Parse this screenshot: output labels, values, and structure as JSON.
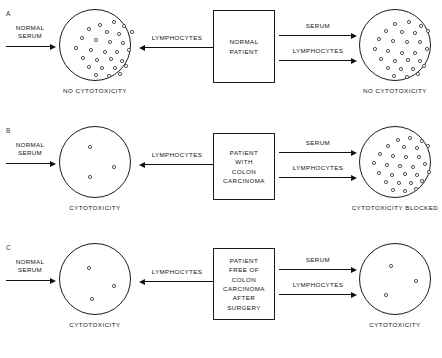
{
  "figure": {
    "type": "diagram",
    "panels": [
      {
        "letter": "A",
        "left_stimulus_label": "NORMAL\nSERUM",
        "middle_arrow_label": "LYMPHOCYTES",
        "center_box_lines": [
          "NORMAL",
          "PATIENT"
        ],
        "right_arrow_labels": [
          "SERUM",
          "LYMPHOCYTES"
        ],
        "left_dish": {
          "caption": "NO CYTOTOXICITY",
          "cell_count": 27,
          "cells": [
            [
              38,
              13
            ],
            [
              52,
              10
            ],
            [
              62,
              14
            ],
            [
              27,
              17
            ],
            [
              45,
              20
            ],
            [
              57,
              22
            ],
            [
              70,
              20
            ],
            [
              20,
              26
            ],
            [
              34,
              28
            ],
            [
              48,
              30
            ],
            [
              61,
              31
            ],
            [
              14,
              36
            ],
            [
              29,
              38
            ],
            [
              43,
              40
            ],
            [
              55,
              40
            ],
            [
              67,
              38
            ],
            [
              21,
              46
            ],
            [
              35,
              48
            ],
            [
              49,
              47
            ],
            [
              60,
              49
            ],
            [
              27,
              55
            ],
            [
              40,
              56
            ],
            [
              53,
              56
            ],
            [
              64,
              54
            ],
            [
              34,
              63
            ],
            [
              47,
              64
            ],
            [
              58,
              62
            ]
          ]
        },
        "right_dish": {
          "caption": "NO CYTOTOXICITY",
          "cell_count": 27,
          "cells": [
            [
              33,
              12
            ],
            [
              47,
              10
            ],
            [
              59,
              14
            ],
            [
              24,
              19
            ],
            [
              40,
              20
            ],
            [
              53,
              21
            ],
            [
              66,
              19
            ],
            [
              17,
              27
            ],
            [
              31,
              29
            ],
            [
              45,
              30
            ],
            [
              58,
              30
            ],
            [
              13,
              37
            ],
            [
              26,
              39
            ],
            [
              40,
              41
            ],
            [
              53,
              41
            ],
            [
              65,
              37
            ],
            [
              19,
              47
            ],
            [
              33,
              49
            ],
            [
              46,
              48
            ],
            [
              58,
              49
            ],
            [
              26,
              56
            ],
            [
              39,
              57
            ],
            [
              51,
              57
            ],
            [
              62,
              54
            ],
            [
              32,
              64
            ],
            [
              45,
              65
            ],
            [
              56,
              62
            ]
          ]
        }
      },
      {
        "letter": "B",
        "left_stimulus_label": "NORMAL\nSERUM",
        "middle_arrow_label": "LYMPHOCYTES",
        "center_box_lines": [
          "PATIENT",
          "WITH",
          "COLON",
          "CARCINOMA"
        ],
        "right_arrow_labels": [
          "SERUM",
          "LYMPHOCYTES"
        ],
        "left_dish": {
          "caption": "CYTOTOXICITY",
          "cell_count": 3,
          "cells": [
            [
              28,
              18
            ],
            [
              52,
              38
            ],
            [
              28,
              48
            ]
          ]
        },
        "right_dish": {
          "caption": "CYTOTOXICITY BLOCKED",
          "cell_count": 28,
          "cells": [
            [
              36,
              11
            ],
            [
              48,
              9
            ],
            [
              60,
              12
            ],
            [
              26,
              17
            ],
            [
              42,
              18
            ],
            [
              55,
              19
            ],
            [
              66,
              17
            ],
            [
              18,
              25
            ],
            [
              31,
              27
            ],
            [
              44,
              28
            ],
            [
              57,
              28
            ],
            [
              12,
              34
            ],
            [
              25,
              36
            ],
            [
              38,
              37
            ],
            [
              51,
              38
            ],
            [
              63,
              35
            ],
            [
              17,
              44
            ],
            [
              30,
              46
            ],
            [
              43,
              45
            ],
            [
              55,
              46
            ],
            [
              67,
              43
            ],
            [
              24,
              53
            ],
            [
              37,
              54
            ],
            [
              49,
              54
            ],
            [
              60,
              52
            ],
            [
              31,
              61
            ],
            [
              43,
              62
            ],
            [
              54,
              60
            ]
          ]
        }
      },
      {
        "letter": "C",
        "left_stimulus_label": "NORMAL\nSERUM",
        "middle_arrow_label": "LYMPHOCYTES",
        "center_box_lines": [
          "PATIENT",
          "FREE OF",
          "COLON",
          "CARCINOMA",
          "AFTER",
          "SURGERY"
        ],
        "right_arrow_labels": [
          "SERUM",
          "LYMPHOCYTES"
        ],
        "left_dish": {
          "caption": "CYTOTOXICITY",
          "cell_count": 3,
          "cells": [
            [
              27,
              22
            ],
            [
              52,
              40
            ],
            [
              30,
              53
            ]
          ]
        },
        "right_dish": {
          "caption": "CYTOTOXICITY",
          "cell_count": 3,
          "cells": [
            [
              29,
              20
            ],
            [
              54,
              35
            ],
            [
              24,
              49
            ]
          ]
        }
      }
    ]
  },
  "icons": {
    "arrow_right": "arrow-right-icon",
    "arrow_left": "arrow-left-icon",
    "cell": "cell-marker-icon",
    "dish": "petri-dish-icon"
  },
  "colors": {
    "background": "#ffffff",
    "stroke": "#1b1b1b",
    "text": "#111111",
    "cell_stroke": "#3a3a3a"
  }
}
